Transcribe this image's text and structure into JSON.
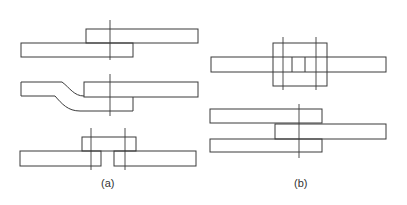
{
  "figure": {
    "labels": {
      "a": "(a)",
      "b": "(b)"
    },
    "panels": [
      {
        "id": "a",
        "description": "Lap joints: simple lap, joggled lap, single butt strap"
      },
      {
        "id": "b",
        "description": "Double butt strap joint and three-plate lap joint"
      }
    ],
    "colors": {
      "line": "#3a3a3a",
      "background": "#ffffff"
    }
  }
}
